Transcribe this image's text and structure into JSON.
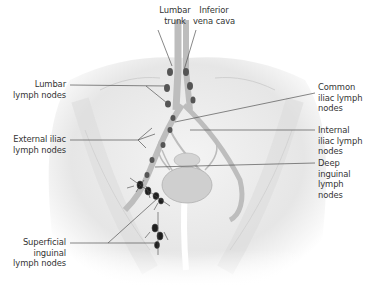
{
  "diagram": {
    "labels": {
      "lumbar_trunk": [
        "Lumbar",
        "trunk"
      ],
      "inferior_vena_cava": [
        "Inferior",
        "vena cava"
      ],
      "lumbar_lymph_nodes": [
        "Lumbar",
        "lymph nodes"
      ],
      "external_iliac_lymph_nodes": [
        "External iliac",
        "lymph nodes"
      ],
      "superficial_inguinal_lymph_nodes": [
        "Superficial",
        "inguinal",
        "lymph nodes"
      ],
      "common_iliac_lymph_nodes": [
        "Common",
        "iliac lymph",
        "nodes"
      ],
      "internal_iliac_lymph_nodes": [
        "Internal",
        "iliac lymph",
        "nodes"
      ],
      "deep_inguinal_lymph_nodes": [
        "Deep",
        "inguinal",
        "lymph",
        "nodes"
      ]
    },
    "colors": {
      "leader_line": "#555555",
      "text": "#333333",
      "tissue": "#d8d8d8",
      "node": "#2a2a2a"
    }
  }
}
